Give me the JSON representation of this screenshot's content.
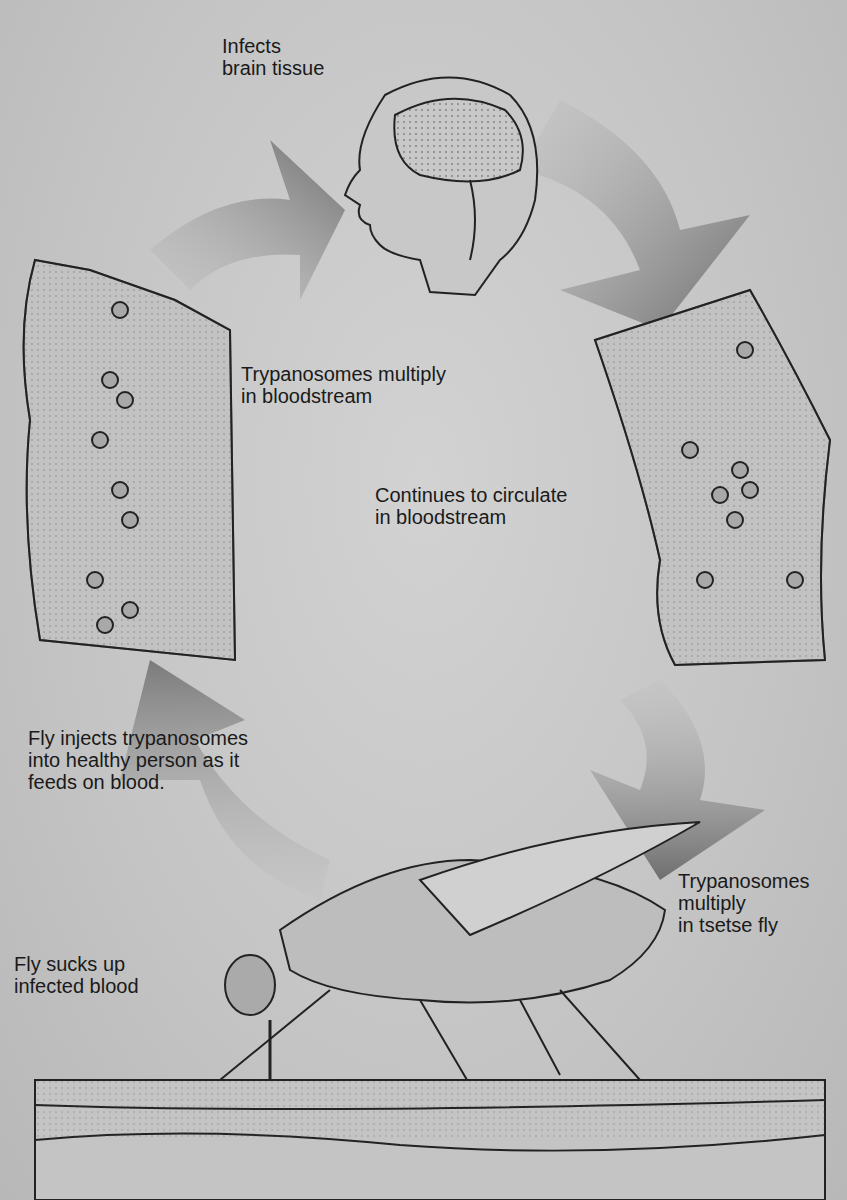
{
  "diagram": {
    "type": "life-cycle",
    "stages": [
      {
        "id": "brain",
        "label": "Infects\nbrain tissue"
      },
      {
        "id": "multiply_blood",
        "label": "Trypanosomes multiply\nin bloodstream"
      },
      {
        "id": "circulate",
        "label": "Continues to circulate\nin bloodstream"
      },
      {
        "id": "inject",
        "label": "Fly injects trypanosomes\ninto healthy person as it\nfeeds on blood."
      },
      {
        "id": "multiply_fly",
        "label": "Trypanosomes\nmultiply\nin tsetse fly"
      },
      {
        "id": "suck",
        "label": "Fly sucks up\ninfected blood"
      }
    ],
    "illustrations": [
      "human-head-with-brain",
      "blood-vessel-left",
      "blood-vessel-right",
      "tsetse-fly",
      "skin-cross-section"
    ],
    "colors": {
      "background": "#c9c9c9",
      "arrow": "#7a7a7a",
      "ink": "#1a1a1a"
    }
  }
}
